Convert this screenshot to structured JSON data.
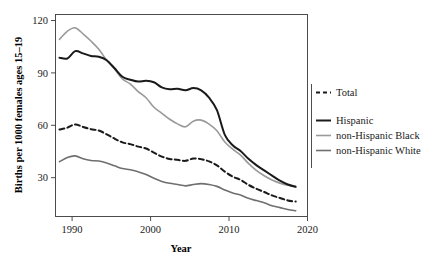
{
  "chart_data": {
    "type": "line",
    "title": "",
    "xlabel": "Year",
    "ylabel": "Births per 1000 females ages 15–19",
    "xlim": [
      1988.5,
      2020.5
    ],
    "ylim": [
      8,
      126
    ],
    "xticks": [
      1990,
      2000,
      2010,
      2020
    ],
    "xtick_labels": [
      "1990",
      "2000",
      "2010",
      "2020"
    ],
    "yticks": [
      30,
      60,
      90,
      120
    ],
    "ytick_labels": [
      "30",
      "60",
      "90",
      "120"
    ],
    "grid": false,
    "legend_position": "right",
    "x": [
      1989,
      1990,
      1991,
      1992,
      1993,
      1994,
      1995,
      1996,
      1997,
      1998,
      1999,
      2000,
      2001,
      2002,
      2003,
      2004,
      2005,
      2006,
      2007,
      2008,
      2009,
      2010,
      2011,
      2012,
      2013,
      2014,
      2015,
      2016,
      2017,
      2018,
      2019
    ],
    "series": [
      {
        "name": "Total",
        "style": "dashed",
        "color": "#1a1a1a",
        "width": 2.0,
        "values": [
          58.8,
          59.9,
          61.8,
          60.3,
          59.0,
          58.2,
          56.0,
          53.5,
          51.3,
          50.3,
          48.8,
          47.7,
          45.3,
          43.0,
          41.6,
          41.1,
          40.5,
          41.9,
          41.5,
          40.2,
          37.9,
          34.2,
          31.3,
          29.4,
          26.5,
          24.2,
          22.3,
          20.3,
          18.8,
          17.4,
          16.7
        ]
      },
      {
        "name": "Hispanic",
        "style": "solid",
        "color": "#1a1a1a",
        "width": 2.0,
        "values": [
          100.8,
          100.3,
          104.6,
          103.3,
          101.8,
          101.3,
          99.3,
          94.6,
          89.6,
          87.9,
          86.8,
          87.3,
          86.4,
          83.4,
          82.3,
          82.6,
          81.7,
          83.0,
          81.7,
          77.4,
          70.1,
          55.7,
          49.6,
          46.3,
          41.7,
          38.0,
          34.9,
          31.9,
          28.9,
          26.7,
          25.3
        ]
      },
      {
        "name": "non-Hispanic Black",
        "style": "solid",
        "color": "#9a9a9a",
        "width": 1.6,
        "values": [
          111.5,
          116.2,
          118.2,
          114.7,
          110.5,
          105.7,
          99.3,
          94.2,
          88.3,
          85.4,
          81.0,
          77.4,
          71.8,
          68.3,
          64.8,
          62.1,
          60.4,
          63.7,
          64.3,
          62.0,
          58.1,
          51.5,
          47.3,
          43.9,
          39.0,
          34.9,
          31.8,
          29.3,
          27.5,
          26.3,
          25.8
        ]
      },
      {
        "name": "non-Hispanic White",
        "style": "solid",
        "color": "#6f6f6f",
        "width": 1.6,
        "values": [
          40.0,
          42.5,
          43.4,
          41.7,
          40.7,
          40.4,
          39.3,
          37.6,
          36.0,
          35.3,
          34.1,
          32.6,
          30.3,
          28.5,
          27.4,
          26.7,
          25.9,
          26.7,
          27.2,
          26.7,
          25.6,
          23.5,
          21.7,
          20.5,
          18.6,
          17.3,
          16.0,
          14.3,
          13.2,
          12.1,
          11.4
        ]
      }
    ]
  },
  "axes": {
    "y_title": "Births per 1000 females ages 15–19",
    "x_title": "Year",
    "x_tick_labels": [
      "1990",
      "2000",
      "2010",
      "2020"
    ],
    "y_tick_labels": [
      "30",
      "60",
      "90",
      "120"
    ]
  },
  "legend": {
    "items": [
      {
        "label": "Total",
        "swatch": "dashed-black"
      },
      {
        "label": "Hispanic",
        "swatch": "solid-black"
      },
      {
        "label": "non-Hispanic Black",
        "swatch": "solid-light-gray"
      },
      {
        "label": "non-Hispanic White",
        "swatch": "solid-gray"
      }
    ]
  }
}
